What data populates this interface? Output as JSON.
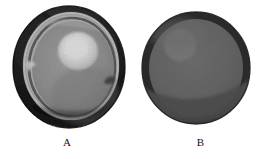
{
  "figure": {
    "background_color": "#ffffff",
    "width": 267,
    "height": 159,
    "panel_count": 2
  },
  "panels": [
    {
      "id": "A",
      "caption": "A",
      "description": "Gross cross-section of a spherical specimen with thick dark outer capsule, pale inner cortical ring, mid-gray parenchyma and a bright rounded nodule in the upper-right of the interior",
      "shape": "ellipse",
      "center_x": 71,
      "center_y": 67,
      "radius_x": 56,
      "radius_y": 61,
      "colors": {
        "outer_rim": "#181818",
        "outer_rim_mid": "#2b2b2b",
        "capsule_ring": "#b9b9b9",
        "capsule_ring_dark": "#5a5a5a",
        "inner_body": "#8e8e8e",
        "inner_body_shadow": "#7a7a7a",
        "nodule": "#d2d2d2",
        "nodule_core": "#dedede",
        "notch": "#cfcfcf"
      },
      "nodule": {
        "center_x": 78,
        "center_y": 51,
        "radius_x": 20,
        "radius_y": 19,
        "label": "bright-nodule"
      }
    },
    {
      "id": "B",
      "caption": "B",
      "description": "Uniform spherical specimen with a dark narrow rim, homogeneous mid-gray interior, a faint lighter round nodule in the upper-left quadrant and a darker crescent band across the lower third",
      "shape": "circle",
      "center_x": 196,
      "center_y": 68,
      "radius_x": 54,
      "radius_y": 56,
      "colors": {
        "outer_rim": "#2c2c2c",
        "outer_rim_inner": "#3a3a3a",
        "inner_body": "#646464",
        "lower_band": "#4f4f4f",
        "nodule": "#767676"
      },
      "nodule": {
        "center_x": 180,
        "center_y": 45,
        "radius_x": 16,
        "radius_y": 16,
        "label": "faint-nodule"
      }
    }
  ],
  "captions": {
    "panel_a_label": "A",
    "panel_b_label": "B"
  }
}
